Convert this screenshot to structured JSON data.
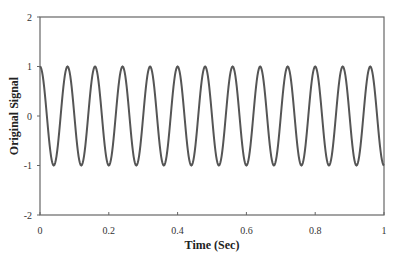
{
  "chart_data": {
    "type": "line",
    "title": "",
    "xlabel": "Time (Sec)",
    "ylabel": "Original Signal",
    "xlim": [
      0,
      1
    ],
    "ylim": [
      -2,
      2
    ],
    "x_ticks": [
      0,
      0.2,
      0.4,
      0.6,
      0.8,
      1
    ],
    "x_tick_labels": [
      "0",
      "0.2",
      "0.4",
      "0.6",
      "0.8",
      "1"
    ],
    "y_ticks": [
      2,
      1,
      0,
      -1,
      -2
    ],
    "y_tick_labels": [
      "2",
      "1",
      "0",
      "-1",
      "-2"
    ],
    "grid": false,
    "legend": null,
    "series": [
      {
        "name": "Original Signal",
        "function": "cos(2*pi*12.5*t)",
        "frequency_hz": 12.5,
        "amplitude": 1,
        "color": "#555555",
        "samples": 500
      }
    ]
  },
  "colors": {
    "line": "#555555",
    "axis": "#555555",
    "background": "#ffffff"
  }
}
